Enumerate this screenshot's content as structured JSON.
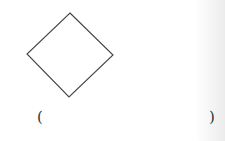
{
  "figure": {
    "shape": "diamond",
    "stroke_color": "#444444",
    "vertices": {
      "top": [
        70,
        13
      ],
      "right": [
        113,
        55
      ],
      "bottom": [
        69,
        97
      ],
      "left": [
        27,
        54
      ]
    }
  },
  "answer_blank": {
    "open": "(",
    "close": ")",
    "value": ""
  }
}
